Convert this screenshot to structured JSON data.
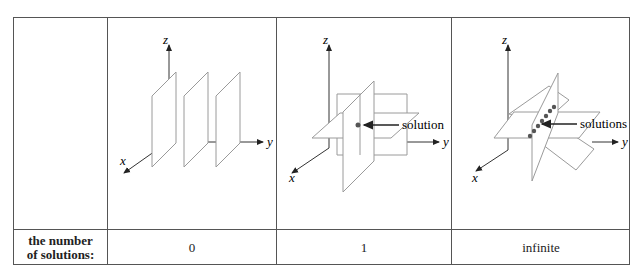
{
  "table": {
    "row_header": "the number\nof solutions:",
    "row_header_lines": [
      "the number",
      "of solutions:"
    ],
    "columns": [
      {
        "diagram": "three-parallel-planes",
        "axes": {
          "x": "x",
          "y": "y",
          "z": "z"
        },
        "annotation": "",
        "count": "0"
      },
      {
        "diagram": "three-planes-meeting-at-point",
        "axes": {
          "x": "x",
          "y": "y",
          "z": "z"
        },
        "annotation": "solution",
        "count": "1"
      },
      {
        "diagram": "three-planes-meeting-along-line",
        "axes": {
          "x": "x",
          "y": "y",
          "z": "z"
        },
        "annotation": "solutions",
        "count": "infinite"
      }
    ]
  },
  "colors": {
    "border": "#555555",
    "plane_stroke": "#9a9a9a",
    "axis": "#333333",
    "point": "#555555"
  }
}
